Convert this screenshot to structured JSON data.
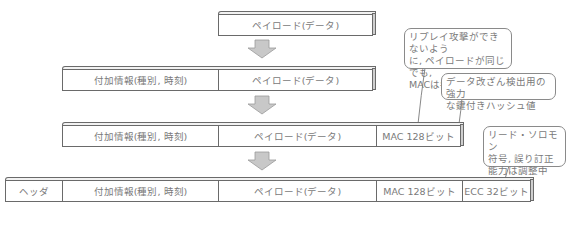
{
  "diagram": {
    "rows": [
      {
        "id": "row1",
        "cells": [
          {
            "label": "ペイロード(データ)"
          }
        ]
      },
      {
        "id": "row2",
        "cells": [
          {
            "label": "付加情報(種別, 時刻)"
          },
          {
            "label": "ペイロード(データ)"
          }
        ]
      },
      {
        "id": "row3",
        "cells": [
          {
            "label": "付加情報(種別, 時刻)"
          },
          {
            "label": "ペイロード(データ)"
          },
          {
            "label": "MAC 128ビット"
          }
        ]
      },
      {
        "id": "row4",
        "cells": [
          {
            "label": "ヘッダ"
          },
          {
            "label": "付加情報(種別, 時刻)"
          },
          {
            "label": "ペイロード(データ)"
          },
          {
            "label": "MAC 128ビット"
          },
          {
            "label": "ECC 32ビット"
          }
        ]
      }
    ],
    "callouts": [
      {
        "id": "replay",
        "lines": [
          "リプレイ攻撃ができないよう",
          "に, ペイロードが同じでも,",
          "MACは毎回変更する"
        ]
      },
      {
        "id": "hash",
        "lines": [
          "データ改ざん検出用の強力",
          "な鍵付きハッシュ値"
        ]
      },
      {
        "id": "ecc",
        "lines": [
          "リード・ソロモン",
          "符号, 誤り訂正",
          "能力は調整中"
        ]
      }
    ],
    "colors": {
      "border": "#6a6a6a",
      "arrow_fill": "#c8c8c8",
      "text": "#7a7a7a"
    }
  }
}
